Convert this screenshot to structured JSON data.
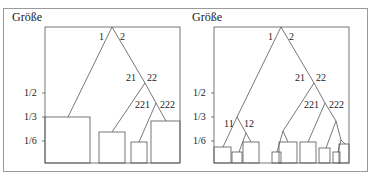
{
  "panels": [
    {
      "title": "Größe",
      "ticks": [
        "1/2",
        "1/3",
        "1/6"
      ],
      "branch_labels": [
        "1",
        "2",
        "21",
        "22",
        "221",
        "222"
      ]
    },
    {
      "title": "Größe",
      "ticks": [
        "1/2",
        "1/3",
        "1/6"
      ],
      "branch_labels": [
        "1",
        "2",
        "21",
        "22",
        "221",
        "222",
        "11",
        "12"
      ]
    }
  ]
}
